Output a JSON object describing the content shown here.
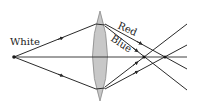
{
  "diagram": {
    "labels": {
      "white": "White",
      "red": "Red",
      "blue": "Blue"
    },
    "colors": {
      "ray": "#2a2a2a",
      "lens_fill": "#c8c8c8",
      "lens_stroke": "#8a8a8a",
      "text": "#222222"
    },
    "elements": {
      "source_point": "point-source",
      "lens": "converging-lens",
      "axis": "optical-axis",
      "focus_blue": "blue-focal-point",
      "focus_red": "red-focal-point"
    }
  }
}
